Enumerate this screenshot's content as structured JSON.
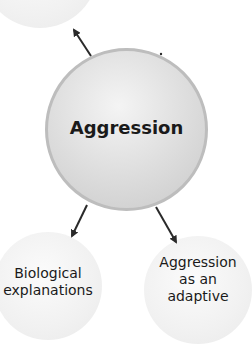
{
  "diagram": {
    "center": {
      "label": "Aggression"
    },
    "nodes": [
      {
        "id": "top-left",
        "label": ""
      },
      {
        "id": "bottom-left",
        "label_lines": [
          "Biological",
          "explanations"
        ]
      },
      {
        "id": "bottom-right",
        "label_lines": [
          "Aggression",
          "as an",
          "adaptive"
        ]
      }
    ],
    "colors": {
      "arrow": "#2a2a2a",
      "center_border": "#bdbdbd",
      "text": "#1a1a1a"
    }
  }
}
